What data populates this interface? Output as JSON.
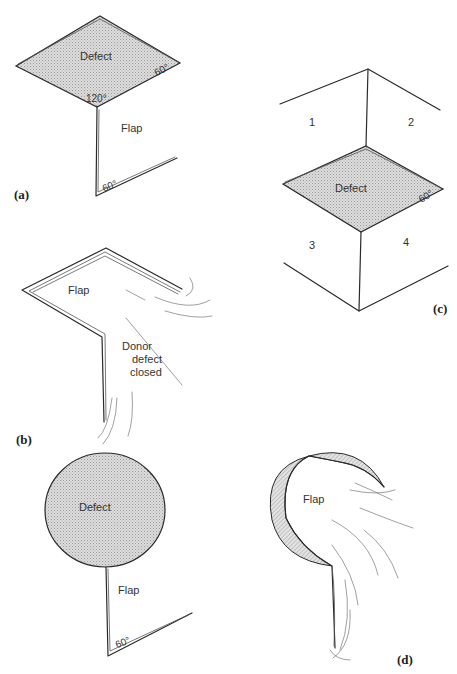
{
  "figure": {
    "panels": [
      {
        "id": "a",
        "label": "(a)",
        "labels": {
          "defect": "Defect",
          "angle_right": "60°",
          "angle_bottom": "120°",
          "flap": "Flap",
          "angle_base": "60°"
        }
      },
      {
        "id": "b",
        "label": "(b)",
        "labels": {
          "flap": "Flap",
          "donor_line1": "Donor",
          "donor_line2": "defect",
          "donor_line3": "closed"
        }
      },
      {
        "id": "c",
        "label": "(c)",
        "labels": {
          "region1": "1",
          "region2": "2",
          "defect": "Defect",
          "angle_right": "60°",
          "region3": "3",
          "region4": "4"
        }
      },
      {
        "id": "d_top",
        "label": "",
        "labels": {
          "defect": "Defect",
          "flap": "Flap",
          "angle_base": "60°"
        }
      },
      {
        "id": "d",
        "label": "(d)",
        "labels": {
          "flap": "Flap"
        }
      }
    ],
    "colors": {
      "line": "#2a2a2a",
      "defect_fill": "#d4d4d4",
      "background": "#ffffff"
    }
  }
}
